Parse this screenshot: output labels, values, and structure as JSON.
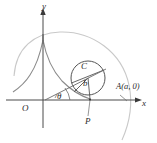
{
  "figure": {
    "colors": {
      "axis": "#4a4a4a",
      "curve": "#7b7b7b",
      "light_arc": "#c9c9c9",
      "circle": "#555555",
      "text": "#2b2b2b"
    },
    "labels": {
      "y_axis": "y",
      "x_axis": "x",
      "origin": "O",
      "point_p": "P",
      "center_c": "C",
      "radius_b": "b",
      "angle_theta": "θ",
      "point_a": "A(a, 0)"
    },
    "geometry": {
      "origin": {
        "x": 43,
        "y": 100
      },
      "x_axis_end": {
        "x": 140,
        "y": 100
      },
      "y_axis_top": {
        "x": 43,
        "y": 10
      },
      "circle_center": {
        "x": 88,
        "y": 78,
        "r": 17
      },
      "point_p": {
        "x": 90,
        "y": 99
      },
      "point_a": {
        "x": 125,
        "y": 100
      },
      "cusp": {
        "x": 43,
        "y": 40
      }
    }
  }
}
